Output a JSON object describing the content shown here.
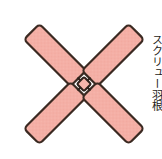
{
  "figure": {
    "background_color": "#ffffff",
    "width": 162,
    "height": 159
  },
  "colors": {
    "blade_fill": "#f6b5ac",
    "blade_fill_shade": "#f2a99f",
    "blade_stroke": "#3b2a22",
    "hub_fill": "#f6b5ac",
    "hub_stroke": "#2e211b",
    "label_text": "#231a16"
  },
  "hub": {
    "label": "center-hub",
    "cx": 84,
    "cy": 84,
    "radius": 6
  },
  "blades": [
    {
      "name": "blade-upper-left",
      "angle_deg": -135,
      "length": 66,
      "width": 22,
      "corner_radius": 4,
      "fill": "#f6b5ac",
      "stroke": "#3b2a22"
    },
    {
      "name": "blade-upper-right",
      "angle_deg": -45,
      "length": 66,
      "width": 22,
      "corner_radius": 4,
      "fill": "#f6b5ac",
      "stroke": "#3b2a22"
    },
    {
      "name": "blade-lower-left",
      "angle_deg": 135,
      "length": 66,
      "width": 22,
      "corner_radius": 4,
      "fill": "#f6b5ac",
      "stroke": "#3b2a22"
    },
    {
      "name": "blade-lower-right",
      "angle_deg": 45,
      "length": 66,
      "width": 22,
      "corner_radius": 4,
      "fill": "#f6b5ac",
      "stroke": "#3b2a22"
    }
  ],
  "side_label": {
    "name": "vertical-caption",
    "text": "スクリュー羽根",
    "orientation": "vertical",
    "clipped": true
  }
}
